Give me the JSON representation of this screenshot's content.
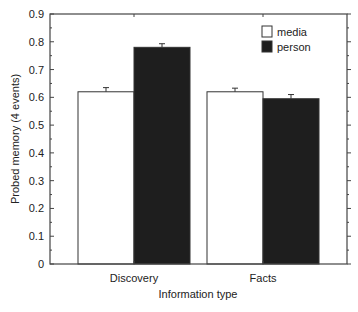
{
  "chart_data": {
    "type": "bar",
    "title": "",
    "xlabel": "Information type",
    "ylabel": "Probed memory (4 events)",
    "ylim": [
      0,
      0.9
    ],
    "yticks": [
      "0",
      "0.1",
      "0.2",
      "0.3",
      "0.4",
      "0.5",
      "0.6",
      "0.7",
      "0.8",
      "0.9"
    ],
    "categories": [
      "Discovery",
      "Facts"
    ],
    "series": [
      {
        "name": "media",
        "color": "#ffffff",
        "values": [
          0.62,
          0.62
        ],
        "errors": [
          0.015,
          0.013
        ]
      },
      {
        "name": "person",
        "color": "#1e1e1e",
        "values": [
          0.78,
          0.595
        ],
        "errors": [
          0.013,
          0.015
        ]
      }
    ],
    "legend": {
      "position": "upper right",
      "entries": [
        "media",
        "person"
      ]
    },
    "grid": false
  }
}
